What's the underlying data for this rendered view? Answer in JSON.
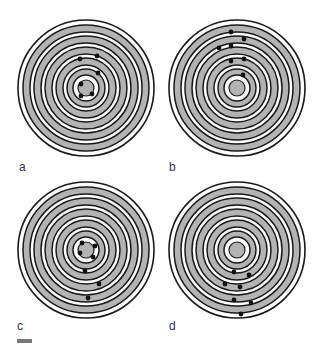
{
  "figure": {
    "colors": {
      "background": "#ffffff",
      "line": "#1a1a1a",
      "band_fill": "#b3b3b3",
      "nucleus_fill": "#b3b3b3",
      "dot": "#111111",
      "label": "#333333",
      "scale_bar": "#777777"
    },
    "ring_model": {
      "outer_circle_r": 68,
      "bands": [
        [
          63,
          56
        ],
        [
          52,
          45
        ],
        [
          41,
          34
        ],
        [
          30,
          23
        ],
        [
          19,
          13
        ]
      ],
      "nucleus_r": 8
    },
    "panels": [
      {
        "label": "a",
        "center": [
          86,
          88
        ],
        "label_pos": [
          19,
          161
        ],
        "dots": [
          [
            80,
            59
          ],
          [
            97,
            56
          ],
          [
            98,
            73
          ],
          [
            81,
            84
          ],
          [
            81,
            96
          ],
          [
            92,
            94
          ]
        ]
      },
      {
        "label": "b",
        "center": [
          237,
          88
        ],
        "label_pos": [
          169,
          161
        ],
        "dots": [
          [
            231,
            32
          ],
          [
            244,
            39
          ],
          [
            219,
            48
          ],
          [
            231,
            46
          ],
          [
            231,
            61
          ],
          [
            244,
            59
          ],
          [
            243,
            75
          ]
        ]
      },
      {
        "label": "c",
        "center": [
          86,
          250
        ],
        "label_pos": [
          17,
          320
        ],
        "dots": [
          [
            82,
            243
          ],
          [
            95,
            246
          ],
          [
            80,
            253
          ],
          [
            93,
            257
          ],
          [
            85,
            271
          ],
          [
            99,
            284
          ],
          [
            88,
            298
          ]
        ]
      },
      {
        "label": "d",
        "center": [
          237,
          250
        ],
        "label_pos": [
          169,
          320
        ],
        "dots": [
          [
            234,
            272
          ],
          [
            249,
            275
          ],
          [
            225,
            284
          ],
          [
            240,
            287
          ],
          [
            234,
            300
          ],
          [
            251,
            303
          ],
          [
            241,
            314
          ]
        ]
      }
    ],
    "scale_bar": {
      "x": 17,
      "y": 339,
      "width": 15,
      "height": 4
    }
  }
}
